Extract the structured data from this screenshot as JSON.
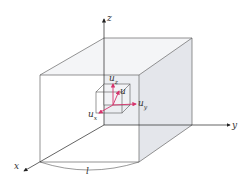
{
  "figure": {
    "type": "3d-element-diagram"
  },
  "axes": {
    "x": {
      "label": "x"
    },
    "y": {
      "label": "y"
    },
    "z": {
      "label": "z"
    }
  },
  "vectors": {
    "u": {
      "label": "u"
    },
    "ux": {
      "base": "u",
      "sub": "x"
    },
    "uy": {
      "base": "u",
      "sub": "y"
    },
    "uz": {
      "base": "u",
      "sub": "z"
    }
  },
  "dimension": {
    "label": "l"
  },
  "colors": {
    "line": "#555555",
    "shade": "#e9eaee",
    "vector": "#d6336c",
    "text": "#333333"
  }
}
